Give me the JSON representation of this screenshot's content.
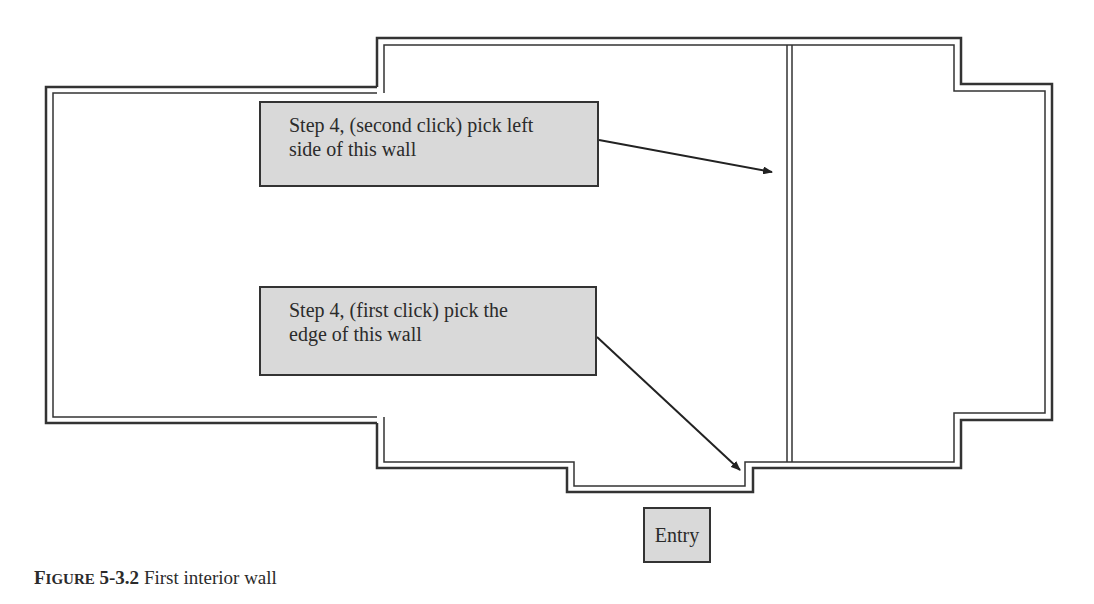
{
  "callouts": {
    "second_click": {
      "line1": "Step 4, (second click) pick left",
      "line2": "side of this wall"
    },
    "first_click": {
      "line1": "Step 4, (first click) pick the",
      "line2": "edge of this wall"
    }
  },
  "entry_label": "Entry",
  "caption": {
    "figure_prefix_first": "F",
    "figure_prefix_rest": "IGURE",
    "figure_number": "5-3.2",
    "title": "First interior wall"
  },
  "colors": {
    "wall": "#333333",
    "callout_fill": "#d9d9d9",
    "background": "#ffffff"
  }
}
